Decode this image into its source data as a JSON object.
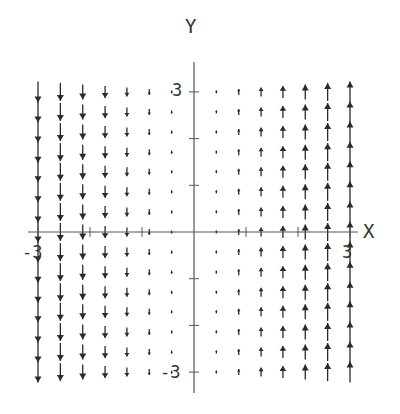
{
  "chart_data": {
    "type": "vector_field",
    "title": "",
    "xlabel": "X",
    "ylabel": "Y",
    "field": {
      "u": "0",
      "v": "x"
    },
    "xlim": [
      -3,
      3
    ],
    "ylim": [
      -3,
      3
    ],
    "x_tick_labels": [
      "-3",
      "3"
    ],
    "y_tick_labels": [
      "3",
      "-3"
    ],
    "x_ticks": [
      -3,
      -2,
      -1,
      1,
      2,
      3
    ],
    "y_ticks": [
      -3,
      -2,
      -1,
      1,
      2,
      3
    ],
    "grid": false,
    "columns_x": [
      -3.0,
      -2.57,
      -2.14,
      -1.71,
      -1.29,
      -0.86,
      -0.43,
      0.43,
      0.86,
      1.29,
      1.71,
      2.14,
      2.57,
      3.0
    ],
    "rows_y": [
      3.0,
      2.57,
      2.14,
      1.71,
      1.29,
      0.86,
      0.43,
      0.0,
      -0.43,
      -0.86,
      -1.29,
      -1.71,
      -2.14,
      -2.57,
      -3.0
    ]
  },
  "axes": {
    "x_label": "X",
    "y_label": "Y",
    "x_min_label": "-3",
    "x_max_label": "3",
    "y_max_label": "3",
    "y_min_label": "-3"
  },
  "colors": {
    "arrow": "#2a2a2a",
    "axis": "#555555",
    "background": "#ffffff"
  }
}
